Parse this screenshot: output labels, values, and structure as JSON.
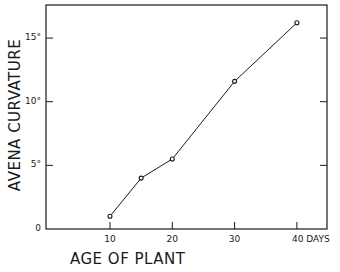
{
  "chart_data": {
    "type": "line",
    "title": "",
    "xlabel": "AGE OF PLANT",
    "ylabel": "AVENA CURVATURE",
    "x_unit": "DAYS",
    "x": [
      10,
      15,
      20,
      30,
      40
    ],
    "series": [
      {
        "name": "Avena curvature",
        "values": [
          1.0,
          4.0,
          5.5,
          11.6,
          16.2
        ],
        "marker": "open-circle"
      }
    ],
    "xticks": [
      10,
      20,
      30,
      40
    ],
    "xtick_labels": [
      "10",
      "20",
      "30",
      "40 DAYS"
    ],
    "yticks": [
      0,
      5,
      10,
      15
    ],
    "ytick_labels": [
      "0",
      "5°",
      "10°",
      "15°"
    ],
    "xlim": [
      -1.5,
      45
    ],
    "ylim": [
      0,
      17.5
    ],
    "grid": false,
    "legend": null,
    "box": true
  },
  "labels": {
    "ylabel": "AVENA CURVATURE",
    "xlabel": "AGE OF PLANT",
    "yticks": [
      {
        "text": "15°",
        "value": 15
      },
      {
        "text": "10°",
        "value": 10
      },
      {
        "text": "5°",
        "value": 5
      },
      {
        "text": "0",
        "value": 0
      }
    ],
    "xticks": [
      {
        "text": "10",
        "value": 10
      },
      {
        "text": "20",
        "value": 20
      },
      {
        "text": "30",
        "value": 30
      },
      {
        "text": "40 DAYS",
        "value": 40
      }
    ]
  },
  "colors": {
    "ink": "#1a1a1a",
    "background": "#ffffff"
  }
}
